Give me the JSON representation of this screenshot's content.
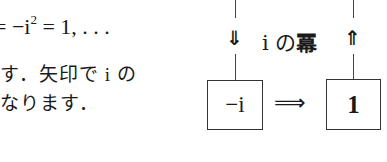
{
  "text": {
    "line1_prefix": "= ",
    "line1_minus_i": "−i",
    "line1_exp": "2",
    "line1_rest": " = 1, . . .",
    "line2": "す．矢印で i の",
    "line3": "なります．"
  },
  "diagram": {
    "down_arrow": "⇓",
    "up_arrow": "⇑",
    "label_i": "i ",
    "label_no": "の",
    "label_power": "冪",
    "implies_arrow": "⟹",
    "left_box": "−i",
    "right_box": "1"
  }
}
